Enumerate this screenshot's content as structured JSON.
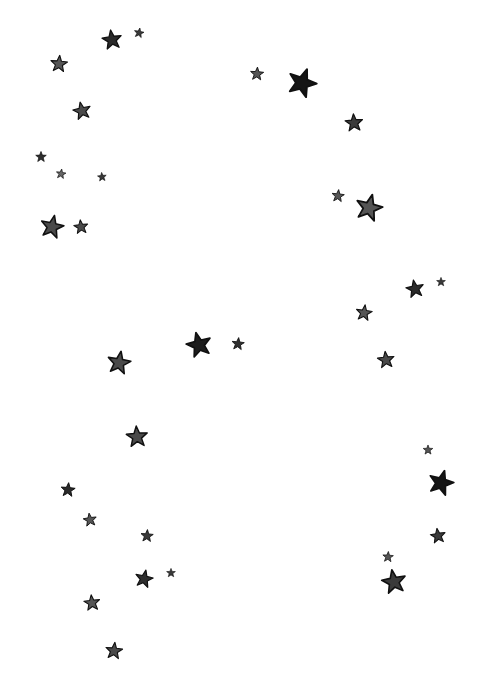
{
  "image": {
    "background": "#ffffff",
    "description": "Hand-drawn scattered stars on white background",
    "stars": [
      {
        "x": 112,
        "y": 40,
        "size": 22,
        "fill": "#2a2a2a",
        "rot": -8
      },
      {
        "x": 139,
        "y": 33,
        "size": 11,
        "fill": "#3a3a3a",
        "rot": 10
      },
      {
        "x": 59,
        "y": 64,
        "size": 19,
        "fill": "#555555",
        "rot": 5
      },
      {
        "x": 82,
        "y": 111,
        "size": 20,
        "fill": "#4a4a4a",
        "rot": -12
      },
      {
        "x": 41,
        "y": 157,
        "size": 12,
        "fill": "#2f2f2f",
        "rot": 0
      },
      {
        "x": 61,
        "y": 174,
        "size": 11,
        "fill": "#666666",
        "rot": 8
      },
      {
        "x": 102,
        "y": 177,
        "size": 10,
        "fill": "#3a3a3a",
        "rot": -5
      },
      {
        "x": 52,
        "y": 227,
        "size": 26,
        "fill": "#4a4a4a",
        "rot": 12
      },
      {
        "x": 81,
        "y": 227,
        "size": 16,
        "fill": "#4a4a4a",
        "rot": -6
      },
      {
        "x": 257,
        "y": 74,
        "size": 15,
        "fill": "#555555",
        "rot": 4
      },
      {
        "x": 302,
        "y": 83,
        "size": 32,
        "fill": "#151515",
        "rot": 20
      },
      {
        "x": 354,
        "y": 123,
        "size": 20,
        "fill": "#3a3a3a",
        "rot": -4
      },
      {
        "x": 338,
        "y": 196,
        "size": 14,
        "fill": "#555555",
        "rot": 6
      },
      {
        "x": 369,
        "y": 208,
        "size": 30,
        "fill": "#555555",
        "rot": 14
      },
      {
        "x": 415,
        "y": 289,
        "size": 20,
        "fill": "#2a2a2a",
        "rot": -10
      },
      {
        "x": 441,
        "y": 282,
        "size": 10,
        "fill": "#3a3a3a",
        "rot": 0
      },
      {
        "x": 364,
        "y": 313,
        "size": 18,
        "fill": "#555555",
        "rot": 8
      },
      {
        "x": 386,
        "y": 360,
        "size": 19,
        "fill": "#4a4a4a",
        "rot": -6
      },
      {
        "x": 199,
        "y": 345,
        "size": 28,
        "fill": "#1e1e1e",
        "rot": -14
      },
      {
        "x": 238,
        "y": 344,
        "size": 14,
        "fill": "#2f2f2f",
        "rot": 6
      },
      {
        "x": 119,
        "y": 363,
        "size": 26,
        "fill": "#4a4a4a",
        "rot": 10
      },
      {
        "x": 137,
        "y": 437,
        "size": 24,
        "fill": "#4a4a4a",
        "rot": -4
      },
      {
        "x": 68,
        "y": 490,
        "size": 16,
        "fill": "#2a2a2a",
        "rot": 5
      },
      {
        "x": 90,
        "y": 520,
        "size": 15,
        "fill": "#555555",
        "rot": -8
      },
      {
        "x": 147,
        "y": 536,
        "size": 14,
        "fill": "#3a3a3a",
        "rot": 4
      },
      {
        "x": 144,
        "y": 579,
        "size": 20,
        "fill": "#2f2f2f",
        "rot": 12
      },
      {
        "x": 171,
        "y": 573,
        "size": 10,
        "fill": "#3a3a3a",
        "rot": 0
      },
      {
        "x": 92,
        "y": 603,
        "size": 18,
        "fill": "#555555",
        "rot": -6
      },
      {
        "x": 114,
        "y": 651,
        "size": 19,
        "fill": "#4a4a4a",
        "rot": 6
      },
      {
        "x": 428,
        "y": 450,
        "size": 11,
        "fill": "#555555",
        "rot": 0
      },
      {
        "x": 441,
        "y": 483,
        "size": 28,
        "fill": "#151515",
        "rot": 16
      },
      {
        "x": 438,
        "y": 536,
        "size": 17,
        "fill": "#3a3a3a",
        "rot": -8
      },
      {
        "x": 388,
        "y": 557,
        "size": 12,
        "fill": "#555555",
        "rot": 4
      },
      {
        "x": 394,
        "y": 582,
        "size": 27,
        "fill": "#3a3a3a",
        "rot": -10
      }
    ]
  }
}
